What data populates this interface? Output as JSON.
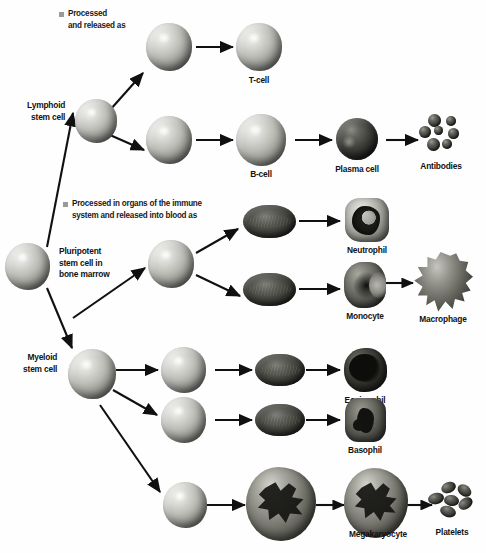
{
  "diagram": {
    "background_color": "#ffffff",
    "ink_color": "#111111",
    "bullet_color": "#9a9a9a"
  },
  "notes": [
    {
      "id": "note-lymphoid",
      "text": "Processed\nand  released as",
      "bullet": "square-bullet"
    },
    {
      "id": "note-myeloid",
      "text": "Processed in organs of the immune\nsystem and released into blood as",
      "bullet": "square-bullet"
    }
  ],
  "stem_cells": [
    {
      "id": "pluripotent",
      "label": "Pluripotent\nstem cell in\nbone marrow",
      "shape": "sphere"
    },
    {
      "id": "lymphoid",
      "label": "Lymphoid\nstem cell",
      "shape": "sphere"
    },
    {
      "id": "myeloid",
      "label": "Myeloid\nstem cell",
      "shape": "sphere"
    }
  ],
  "cells": [
    {
      "id": "t-progenitor",
      "label": "",
      "shape": "sphere"
    },
    {
      "id": "t-cell",
      "label": "T-cell",
      "shape": "sphere"
    },
    {
      "id": "b-progenitor",
      "label": "",
      "shape": "sphere"
    },
    {
      "id": "b-cell",
      "label": "B-cell",
      "shape": "sphere"
    },
    {
      "id": "plasma-cell",
      "label": "Plasma cell",
      "shape": "sphere-dark"
    },
    {
      "id": "antibodies",
      "label": "Antibodies",
      "shape": "cluster"
    },
    {
      "id": "neutrophil-progenitor",
      "label": "",
      "shape": "capsule"
    },
    {
      "id": "neutrophil",
      "label": "Neutrophil",
      "shape": "neutrophil"
    },
    {
      "id": "monocyte-progenitor",
      "label": "",
      "shape": "capsule"
    },
    {
      "id": "monocyte",
      "label": "Monocyte",
      "shape": "monocyte"
    },
    {
      "id": "macrophage",
      "label": "Macrophage",
      "shape": "macrophage"
    },
    {
      "id": "eosinophil-progenitor",
      "label": "",
      "shape": "capsule"
    },
    {
      "id": "eosinophil",
      "label": "Eosinophil",
      "shape": "eosinophil"
    },
    {
      "id": "basophil-progenitor",
      "label": "",
      "shape": "capsule"
    },
    {
      "id": "basophil",
      "label": "Basophil",
      "shape": "basophil"
    },
    {
      "id": "megakaryoblast",
      "label": "",
      "shape": "sphere"
    },
    {
      "id": "megakaryocyte-early",
      "label": "",
      "shape": "megakaryocyte"
    },
    {
      "id": "megakaryocyte",
      "label": "Megakaryocyte",
      "shape": "megakaryocyte"
    },
    {
      "id": "platelets",
      "label": "Platelets",
      "shape": "cluster"
    }
  ]
}
